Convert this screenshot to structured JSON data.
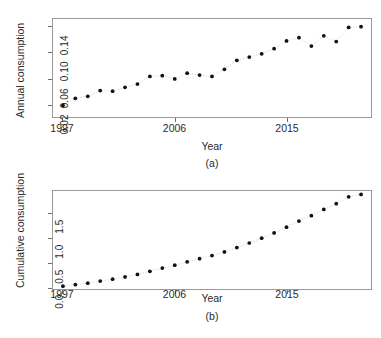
{
  "figure": {
    "panels": [
      {
        "id": "a",
        "caption": "(a)",
        "xlabel": "Year",
        "ylabel": "Annual consumption"
      },
      {
        "id": "b",
        "caption": "(b)",
        "xlabel": "Year",
        "ylabel": "Cumulative consumption"
      }
    ]
  },
  "chart_data": [
    {
      "type": "scatter",
      "title": "",
      "panel_label": "(a)",
      "xlabel": "Year",
      "ylabel": "Annual consumption",
      "grid": false,
      "legend": false,
      "xlim": [
        1996.2,
        2021.8
      ],
      "ylim": [
        0.0,
        0.152
      ],
      "xticks": [
        1997,
        2006,
        2015
      ],
      "xticklabels": [
        "1997",
        "2006",
        "2015"
      ],
      "yticks": [
        0.02,
        0.06,
        0.1,
        0.14
      ],
      "yticklabels": [
        "0.02",
        "0.06",
        "0.10",
        "0.14"
      ],
      "marker": "filled-circle",
      "marker_color": "#111111",
      "line_style": "dotted",
      "line_color": "#c9c9c9",
      "x": [
        1997,
        1998,
        1999,
        2000,
        2001,
        2002,
        2003,
        2004,
        2005,
        2006,
        2007,
        2008,
        2009,
        2010,
        2011,
        2012,
        2013,
        2014,
        2015,
        2016,
        2017,
        2018,
        2019,
        2020,
        2021
      ],
      "values": [
        0.018,
        0.029,
        0.032,
        0.041,
        0.04,
        0.046,
        0.051,
        0.063,
        0.064,
        0.059,
        0.068,
        0.065,
        0.063,
        0.074,
        0.088,
        0.093,
        0.098,
        0.106,
        0.118,
        0.123,
        0.11,
        0.126,
        0.117,
        0.139,
        0.14
      ]
    },
    {
      "type": "scatter",
      "title": "",
      "panel_label": "(b)",
      "xlabel": "Year",
      "ylabel": "Cumulative consumption",
      "grid": false,
      "legend": false,
      "xlim": [
        1996.2,
        2021.8
      ],
      "ylim": [
        -0.04,
        1.95
      ],
      "xticks": [
        1997,
        2006,
        2015
      ],
      "xticklabels": [
        "1997",
        "2006",
        "2015"
      ],
      "yticks": [
        0.0,
        0.5,
        1.0,
        1.5
      ],
      "yticklabels": [
        "0.0",
        "0.5",
        "1.0",
        "1.5"
      ],
      "marker": "filled-circle",
      "marker_color": "#111111",
      "line_style": "dotted",
      "line_color": "#c9c9c9",
      "x": [
        1997,
        1998,
        1999,
        2000,
        2001,
        2002,
        2003,
        2004,
        2005,
        2006,
        2007,
        2008,
        2009,
        2010,
        2011,
        2012,
        2013,
        2014,
        2015,
        2016,
        2017,
        2018,
        2019,
        2020,
        2021
      ],
      "values": [
        0.018,
        0.047,
        0.079,
        0.12,
        0.16,
        0.206,
        0.257,
        0.32,
        0.384,
        0.443,
        0.511,
        0.576,
        0.639,
        0.713,
        0.801,
        0.894,
        0.992,
        1.098,
        1.216,
        1.339,
        1.449,
        1.575,
        1.692,
        1.831,
        1.88
      ]
    }
  ]
}
